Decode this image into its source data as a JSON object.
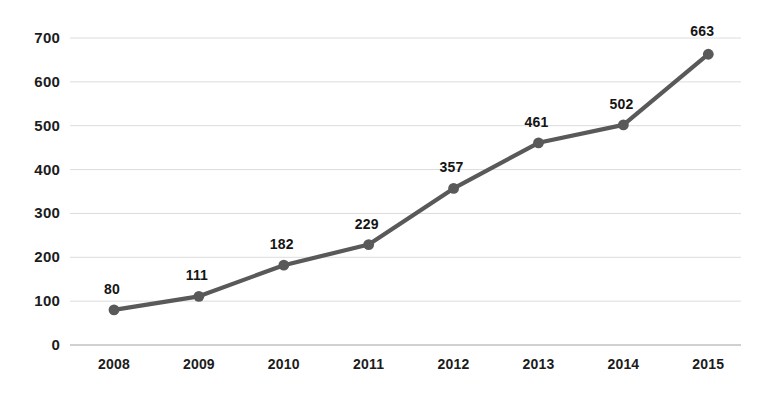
{
  "chart_data": {
    "type": "line",
    "title": "",
    "subtitle": "",
    "xlabel": "",
    "ylabel": "",
    "categories": [
      "2008",
      "2009",
      "2010",
      "2011",
      "2012",
      "2013",
      "2014",
      "2015"
    ],
    "values": [
      80,
      111,
      182,
      229,
      357,
      461,
      502,
      663
    ],
    "point_labels": [
      "80",
      "111",
      "182",
      "229",
      "357",
      "461",
      "502",
      "663"
    ],
    "series": [
      {
        "name": "",
        "values": [
          80,
          111,
          182,
          229,
          357,
          461,
          502,
          663
        ]
      }
    ],
    "ylim": [
      0,
      700
    ],
    "ytick_values": [
      0,
      100,
      200,
      300,
      400,
      500,
      600,
      700
    ],
    "ytick_labels": [
      "0",
      "100",
      "200",
      "300",
      "400",
      "500",
      "600",
      "700"
    ],
    "xtick_labels": [
      "2008",
      "2009",
      "2010",
      "2011",
      "2012",
      "2013",
      "2014",
      "2015"
    ],
    "grid": true,
    "grid_axis": "y",
    "legend": false,
    "legend_position": "none",
    "data_labels_shown": true,
    "markers": "circle",
    "colors": {
      "line": "#595959",
      "marker": "#595959",
      "gridline": "#dcdcdc",
      "axis_line": "#c9c9c9",
      "tick_text": "#1c1c1c",
      "label_text": "#151515",
      "background": "#ffffff"
    }
  }
}
